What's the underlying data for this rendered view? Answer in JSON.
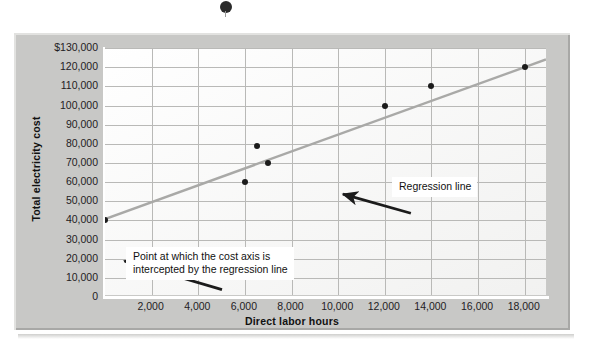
{
  "chart_data": {
    "type": "scatter",
    "title": "",
    "xlabel": "Direct labor hours",
    "ylabel": "Total electricity cost",
    "xlim": [
      0,
      19000
    ],
    "ylim": [
      0,
      130000
    ],
    "grid": true,
    "legend": "none",
    "x_ticks": [
      "2,000",
      "4,000",
      "6,000",
      "8,000",
      "10,000",
      "12,000",
      "14,000",
      "16,000",
      "18,000"
    ],
    "x_tick_values": [
      2000,
      4000,
      6000,
      8000,
      10000,
      12000,
      14000,
      16000,
      18000
    ],
    "y_ticks": [
      "$130,000",
      "120,000",
      "110,000",
      "100,000",
      "90,000",
      "80,000",
      "70,000",
      "60,000",
      "50,000",
      "40,000",
      "30,000",
      "20,000",
      "10,000",
      "0"
    ],
    "y_tick_values": [
      130000,
      120000,
      110000,
      100000,
      90000,
      80000,
      70000,
      60000,
      50000,
      40000,
      30000,
      20000,
      10000,
      0
    ],
    "points": [
      {
        "x": 0,
        "y": 40000
      },
      {
        "x": 6000,
        "y": 60000
      },
      {
        "x": 6500,
        "y": 79000
      },
      {
        "x": 7000,
        "y": 70000
      },
      {
        "x": 12000,
        "y": 100000
      },
      {
        "x": 14000,
        "y": 110000
      },
      {
        "x": 18000,
        "y": 120000
      }
    ],
    "series": [
      {
        "name": "Regression line",
        "type": "line",
        "intercept": 40000,
        "slope": 4.44,
        "endpoints": [
          {
            "x": 0,
            "y": 40000
          },
          {
            "x": 19000,
            "y": 124000
          }
        ]
      }
    ],
    "annotations": [
      {
        "name": "regression-line-callout",
        "text": "Regression line",
        "points_to": {
          "x": 9500,
          "y": 82000
        }
      },
      {
        "name": "intercept-callout",
        "line1": "Point at which the cost axis is",
        "line2": "intercepted by the regression line",
        "points_to": {
          "x": 0,
          "y": 40000
        }
      }
    ],
    "colors": {
      "panel": "#c8c8c6",
      "plot_background": "#fdfdfd",
      "gridline": "#b9b9b7",
      "regression_line": "#a9a9a7",
      "datapoint": "#1b1b1b",
      "axis": "#ffffff",
      "text": "#23201e"
    }
  },
  "artifacts": {
    "scan_mark": "binding-hole-mark"
  }
}
